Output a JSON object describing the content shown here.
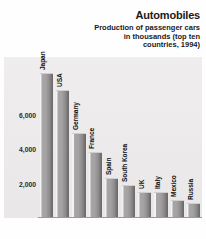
{
  "chart_data": {
    "type": "bar",
    "title": "Automobiles",
    "subtitle": "Production of passenger cars in thousands (top ten countries, 1994)",
    "xlabel": "",
    "ylabel": "",
    "categories": [
      "Japan",
      "USA",
      "Germany",
      "France",
      "Spain",
      "South Korea",
      "UK",
      "Italy",
      "Mexico",
      "Russia"
    ],
    "values": [
      8400,
      7400,
      4900,
      3800,
      2300,
      1850,
      1450,
      1450,
      1000,
      800
    ],
    "ylim": [
      0,
      9400
    ],
    "yticks": [
      2000,
      4000,
      6000
    ],
    "ytick_labels": [
      "2,000",
      "4,000",
      "6,000"
    ],
    "grid": false,
    "legend": null,
    "units": "thousands of cars",
    "year": 1994
  },
  "colors": {
    "bar_face": "#a3a1a1",
    "bar_shadow": "#6a6868",
    "bar_highlight": "#f4f3f3",
    "panel_background": "#eceaea",
    "text": "#1a1a1a",
    "baseline": "#9a9898"
  }
}
